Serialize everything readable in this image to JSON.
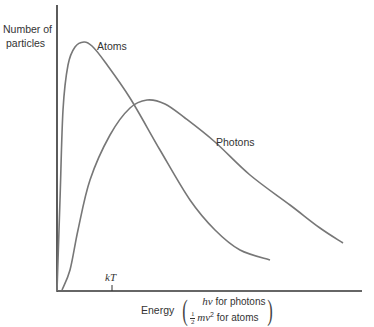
{
  "chart_data": {
    "type": "line",
    "title": "",
    "ylabel": "Number of particles",
    "xlabel": "Energy",
    "xlabel_detail": [
      "hν for photons",
      "½ mv² for atoms"
    ],
    "x_ticks": [
      {
        "label": "kT",
        "x_px": 112
      }
    ],
    "grid": false,
    "legend": "inline labels",
    "axis_color": "#333333",
    "curve_color": "#777777",
    "series": [
      {
        "name": "Atoms",
        "description": "Maxwell-Boltzmann distribution; sharp rise, peak near 0.5 kT, long decaying tail",
        "points_px": [
          [
            57,
            291
          ],
          [
            60,
            200
          ],
          [
            63,
            110
          ],
          [
            68,
            65
          ],
          [
            75,
            47
          ],
          [
            84,
            42
          ],
          [
            92,
            46
          ],
          [
            105,
            62
          ],
          [
            130,
            98
          ],
          [
            160,
            150
          ],
          [
            190,
            200
          ],
          [
            215,
            230
          ],
          [
            240,
            250
          ],
          [
            270,
            260
          ]
        ]
      },
      {
        "name": "Photons",
        "description": "Planck distribution; slower rise, broader peak near 1.6 kT, long tail",
        "points_px": [
          [
            62,
            290
          ],
          [
            70,
            270
          ],
          [
            78,
            230
          ],
          [
            90,
            180
          ],
          [
            110,
            135
          ],
          [
            130,
            108
          ],
          [
            147,
            100
          ],
          [
            165,
            104
          ],
          [
            185,
            118
          ],
          [
            215,
            142
          ],
          [
            250,
            175
          ],
          [
            290,
            205
          ],
          [
            320,
            228
          ],
          [
            343,
            243
          ]
        ]
      }
    ],
    "labels": {
      "y_axis_line1": "Number of",
      "y_axis_line2": "particles",
      "atoms": "Atoms",
      "photons": "Photons",
      "tick_kT": "kT",
      "x_energy": "Energy",
      "x_photon_prefix": "hν",
      "x_photon_suffix": " for photons",
      "x_atom_frac_num": "1",
      "x_atom_frac_den": "2",
      "x_atom_mv": "mv",
      "x_atom_exp": "2",
      "x_atom_suffix": " for atoms"
    }
  }
}
